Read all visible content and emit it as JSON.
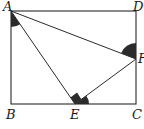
{
  "figure": {
    "colors": {
      "stroke": "#2b2b2b",
      "fill_mark": "#2b2b2b",
      "background": "#ffffff"
    },
    "points": {
      "A": {
        "label": "A",
        "x": 11,
        "y": 11
      },
      "B": {
        "label": "B",
        "x": 11,
        "y": 104
      },
      "C": {
        "label": "C",
        "x": 136,
        "y": 104
      },
      "D": {
        "label": "D",
        "x": 136,
        "y": 11
      },
      "E": {
        "label": "E",
        "x": 75,
        "y": 104
      },
      "F": {
        "label": "F",
        "x": 136,
        "y": 59
      }
    },
    "segments": [
      "AB",
      "BC",
      "CD",
      "DA",
      "AE",
      "AF",
      "EF"
    ],
    "marks": [
      {
        "type": "angle-filled",
        "at": "A",
        "between": [
          "AB",
          "AE"
        ]
      },
      {
        "type": "angle-filled",
        "at": "F",
        "between": [
          "FD",
          "FA"
        ]
      },
      {
        "type": "right-angle",
        "at": "E",
        "between": [
          "EA",
          "EF"
        ]
      },
      {
        "type": "angle-filled",
        "at": "E",
        "between": [
          "EF",
          "EC"
        ]
      }
    ]
  }
}
